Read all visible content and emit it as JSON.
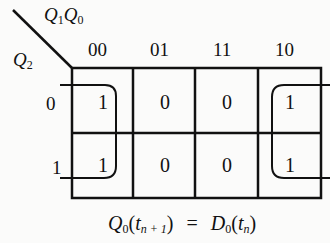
{
  "kmap": {
    "row_variable": "Q2",
    "column_variables": "Q1Q0",
    "column_headers": [
      "00",
      "01",
      "11",
      "10"
    ],
    "row_headers": [
      "0",
      "1"
    ],
    "cells": [
      [
        "1",
        "0",
        "0",
        "1"
      ],
      [
        "1",
        "0",
        "0",
        "1"
      ]
    ],
    "groups": [
      {
        "name": "column-00-group",
        "cells": [
          [
            0,
            0
          ],
          [
            1,
            0
          ]
        ]
      },
      {
        "name": "column-10-group",
        "cells": [
          [
            0,
            3
          ],
          [
            1,
            3
          ]
        ]
      }
    ]
  },
  "labels": {
    "q1": "Q",
    "q1_sub": "1",
    "q0": "Q",
    "q0_sub": "0",
    "q2": "Q",
    "q2_sub": "2",
    "col0": "00",
    "col1": "01",
    "col2": "11",
    "col3": "10",
    "row0": "0",
    "row1": "1"
  },
  "cells": {
    "r0c0": "1",
    "r0c1": "0",
    "r0c2": "0",
    "r0c3": "1",
    "r1c0": "1",
    "r1c1": "0",
    "r1c2": "0",
    "r1c3": "1"
  },
  "equation": {
    "lhs_var": "Q",
    "lhs_sub": "0",
    "lhs_open": "(",
    "lhs_t": "t",
    "lhs_t_sub": "n + 1",
    "lhs_close": ")",
    "eq": "=",
    "rhs_var": "D",
    "rhs_sub": "0",
    "rhs_open": "(",
    "rhs_t": "t",
    "rhs_t_sub": "n",
    "rhs_close": ")"
  }
}
